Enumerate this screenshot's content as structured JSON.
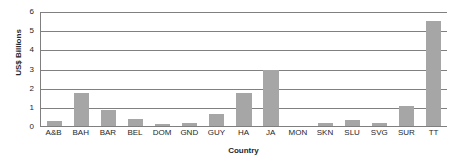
{
  "chart_data": {
    "type": "bar",
    "title": "",
    "xlabel": "Country",
    "ylabel": "US$ Billions",
    "ylim": [
      0,
      6
    ],
    "yticks": [
      0,
      1,
      2,
      3,
      4,
      5,
      6
    ],
    "grid": "horizontal",
    "legend": "none",
    "bar_color": "#a6a6a6",
    "axis_color": "#808080",
    "categories": [
      "A&B",
      "BAH",
      "BAR",
      "BEL",
      "DOM",
      "GND",
      "GUY",
      "HA",
      "JA",
      "MON",
      "SKN",
      "SLU",
      "SVG",
      "SUR",
      "TT"
    ],
    "values": [
      0.25,
      1.7,
      0.85,
      0.35,
      0.1,
      0.15,
      0.62,
      1.7,
      2.9,
      0.0,
      0.15,
      0.3,
      0.17,
      1.05,
      5.5
    ]
  }
}
